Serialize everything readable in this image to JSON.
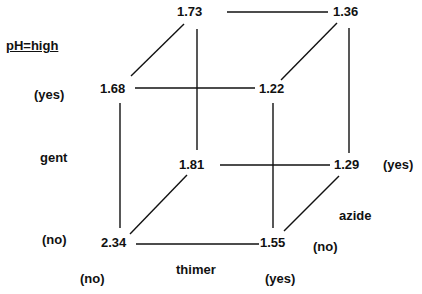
{
  "title": "pH=high",
  "axes": {
    "gent": {
      "label": "gent",
      "yes": "(yes)",
      "no": "(no)"
    },
    "thimer": {
      "label": "thimer",
      "no": "(no)",
      "yes": "(yes)"
    },
    "azide": {
      "label": "azide",
      "yes": "(yes)",
      "no": "(no)"
    }
  },
  "vertices": {
    "back_top_left": "1.73",
    "back_top_right": "1.36",
    "front_top_left": "1.68",
    "front_top_right": "1.22",
    "back_bottom_left": "1.81",
    "back_bottom_right": "1.29",
    "front_bottom_left": "2.34",
    "front_bottom_right": "1.55"
  },
  "colors": {
    "line": "#111111",
    "text": "#111111",
    "background": "#ffffff"
  }
}
